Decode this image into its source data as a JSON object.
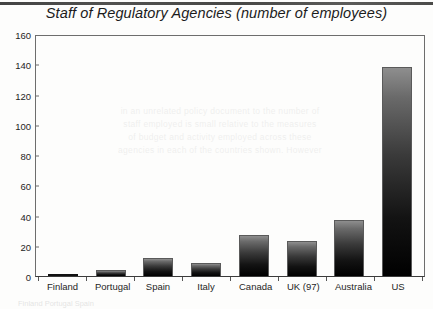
{
  "chart_data": {
    "type": "bar",
    "title": "Staff of Regulatory Agencies (number of employees)",
    "xlabel": "",
    "ylabel": "",
    "categories": [
      "Finland",
      "Portugal",
      "Spain",
      "Italy",
      "Canada",
      "UK (97)",
      "Australia",
      "US"
    ],
    "values": [
      1,
      4,
      12,
      8.5,
      27,
      23,
      37,
      138
    ],
    "ylim": [
      0,
      160
    ],
    "ytick_labels": [
      "0",
      "20",
      "40",
      "60",
      "80",
      "100",
      "120",
      "140",
      "160"
    ],
    "ytick_values": [
      0,
      20,
      40,
      60,
      80,
      100,
      120,
      140,
      160
    ],
    "grid": false,
    "legend": "none",
    "bar_fill": "#1a1a1a",
    "bar_gradient_top": "#8e8e8e",
    "bar_gradient_bottom": "#000000",
    "axis_color": "#6d6d6d",
    "text_color": "#1f1f1f"
  },
  "artifacts": {
    "ghost_text": "in an unrelated policy document to the number of\nstaff employed is small relative to the measures\nof budget and activity employed across these\nagencies in each of the countries shown. However",
    "ghost_text_bottom": "Finland    Portugal    Spain"
  }
}
